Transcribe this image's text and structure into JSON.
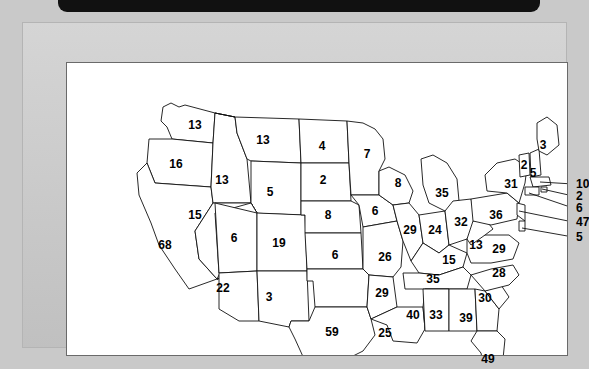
{
  "window": {
    "frame_color": "#c9c9c9",
    "panel_color": "#ffffff",
    "topbar_color": "#111111"
  },
  "chart_data": {
    "type": "map",
    "title": "",
    "subtitle": "",
    "xlabel": "",
    "ylabel": "",
    "legend": "none",
    "grid": false,
    "region": "United States (contiguous 48 states)",
    "value_kind": "count per state",
    "categories": [
      "WA",
      "OR",
      "CA",
      "ID",
      "NV",
      "UT",
      "AZ",
      "MT",
      "WY",
      "CO",
      "NM",
      "ND",
      "SD",
      "NE",
      "KS",
      "OK",
      "TX",
      "MN",
      "IA",
      "MO",
      "AR",
      "LA",
      "WI",
      "IL",
      "MS",
      "MI",
      "IN",
      "KY",
      "TN",
      "AL",
      "OH",
      "WV",
      "GA",
      "FL",
      "SC",
      "NC",
      "VA",
      "PA",
      "NY",
      "VT",
      "NH",
      "ME",
      "MA",
      "RI",
      "CT",
      "NJ",
      "DE",
      "MD"
    ],
    "values": [
      13,
      16,
      68,
      13,
      15,
      6,
      22,
      13,
      5,
      19,
      3,
      4,
      2,
      8,
      6,
      29,
      59,
      7,
      6,
      26,
      25,
      40,
      8,
      29,
      33,
      35,
      24,
      15,
      35,
      39,
      32,
      13,
      39,
      49,
      30,
      28,
      29,
      36,
      31,
      2,
      5,
      3,
      10,
      2,
      6,
      47,
      5,
      0
    ],
    "states": [
      {
        "code": "WA",
        "label": "13",
        "x": 128,
        "y": 62
      },
      {
        "code": "MT",
        "label": "13",
        "x": 196,
        "y": 77
      },
      {
        "code": "ND",
        "label": "4",
        "x": 255,
        "y": 83
      },
      {
        "code": "MN",
        "label": "7",
        "x": 300,
        "y": 91
      },
      {
        "code": "OR",
        "label": "16",
        "x": 109,
        "y": 101
      },
      {
        "code": "ID",
        "label": "13",
        "x": 155,
        "y": 117
      },
      {
        "code": "WY",
        "label": "5",
        "x": 203,
        "y": 129
      },
      {
        "code": "SD",
        "label": "2",
        "x": 256,
        "y": 117
      },
      {
        "code": "WI",
        "label": "8",
        "x": 331,
        "y": 120
      },
      {
        "code": "MI",
        "label": "35",
        "x": 375,
        "y": 130
      },
      {
        "code": "NV",
        "label": "15",
        "x": 128,
        "y": 152
      },
      {
        "code": "UT",
        "label": "6",
        "x": 167,
        "y": 175
      },
      {
        "code": "CO",
        "label": "19",
        "x": 212,
        "y": 180
      },
      {
        "code": "NE",
        "label": "8",
        "x": 261,
        "y": 152
      },
      {
        "code": "IA",
        "label": "6",
        "x": 308,
        "y": 148
      },
      {
        "code": "IL",
        "label": "29",
        "x": 343,
        "y": 167
      },
      {
        "code": "IN",
        "label": "24",
        "x": 368,
        "y": 167
      },
      {
        "code": "OH",
        "label": "32",
        "x": 394,
        "y": 159
      },
      {
        "code": "PA",
        "label": "36",
        "x": 429,
        "y": 152
      },
      {
        "code": "NY",
        "label": "31",
        "x": 444,
        "y": 121
      },
      {
        "code": "CA",
        "label": "68",
        "x": 98,
        "y": 182
      },
      {
        "code": "KS",
        "label": "6",
        "x": 268,
        "y": 192
      },
      {
        "code": "MO",
        "label": "26",
        "x": 318,
        "y": 194
      },
      {
        "code": "WV",
        "label": "13",
        "x": 409,
        "y": 182
      },
      {
        "code": "VA",
        "label": "29",
        "x": 432,
        "y": 186
      },
      {
        "code": "KY",
        "label": "15",
        "x": 382,
        "y": 197
      },
      {
        "code": "AZ",
        "label": "22",
        "x": 156,
        "y": 225
      },
      {
        "code": "NM",
        "label": "3",
        "x": 202,
        "y": 234
      },
      {
        "code": "OK",
        "label": "29",
        "x": 315,
        "y": 230
      },
      {
        "code": "TN",
        "label": "35",
        "x": 366,
        "y": 216
      },
      {
        "code": "NC",
        "label": "28",
        "x": 432,
        "y": 210
      },
      {
        "code": "SC",
        "label": "30",
        "x": 418,
        "y": 235
      },
      {
        "code": "AR",
        "label": "25",
        "x": 318,
        "y": 270
      },
      {
        "code": "LA",
        "label": "40",
        "x": 346,
        "y": 252
      },
      {
        "code": "MS",
        "label": "33",
        "x": 369,
        "y": 252
      },
      {
        "code": "AL",
        "label": "39",
        "x": 399,
        "y": 255
      },
      {
        "code": "TX",
        "label": "59",
        "x": 265,
        "y": 269
      },
      {
        "code": "FL",
        "label": "49",
        "x": 421,
        "y": 296
      },
      {
        "code": "ME",
        "label": "3",
        "x": 476,
        "y": 82
      },
      {
        "code": "VT",
        "label": "2",
        "x": 457,
        "y": 102
      },
      {
        "code": "NH",
        "label": "5",
        "x": 466,
        "y": 110
      }
    ],
    "callouts": [
      {
        "code": "MA",
        "label": "10",
        "x": 509,
        "y": 121,
        "line": {
          "x1": 506,
          "y1": 121,
          "x2": 473,
          "y2": 119
        }
      },
      {
        "code": "RI",
        "label": "2",
        "x": 509,
        "y": 133,
        "line": {
          "x1": 506,
          "y1": 133,
          "x2": 475,
          "y2": 126
        }
      },
      {
        "code": "CT",
        "label": "6",
        "x": 509,
        "y": 145,
        "line": {
          "x1": 506,
          "y1": 145,
          "x2": 462,
          "y2": 130
        }
      },
      {
        "code": "NJ",
        "label": "47",
        "x": 509,
        "y": 159,
        "line": {
          "x1": 506,
          "y1": 159,
          "x2": 452,
          "y2": 148
        }
      },
      {
        "code": "DE",
        "label": "5",
        "x": 509,
        "y": 174,
        "line": {
          "x1": 506,
          "y1": 174,
          "x2": 455,
          "y2": 165
        }
      }
    ]
  }
}
